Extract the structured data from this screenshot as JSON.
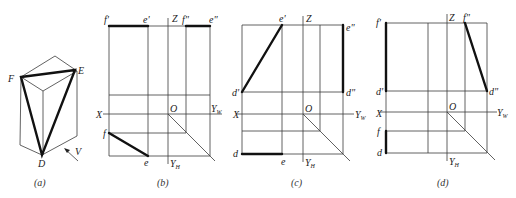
{
  "figure": {
    "panels": [
      {
        "id": "a",
        "caption": "(a)",
        "description": "Isometric view of a prism with triangle DEF drawn on it; arrow V indicates viewing direction",
        "labels": {
          "F": "F",
          "E": "E",
          "D": "D",
          "V": "V"
        }
      },
      {
        "id": "b",
        "caption": "(b)",
        "labels": {
          "f_prime": "f'",
          "e_prime": "e'",
          "Z": "Z",
          "f_dprime": "f\"",
          "e_dprime": "e\"",
          "X": "X",
          "O": "O",
          "Yw": "Y",
          "Yw_sub": "W",
          "f": "f",
          "e": "e",
          "Yh": "Y",
          "Yh_sub": "H"
        }
      },
      {
        "id": "c",
        "caption": "(c)",
        "labels": {
          "e_prime": "e'",
          "Z": "Z",
          "e_dprime": "e\"",
          "d_prime": "d'",
          "d_dprime": "d\"",
          "X": "X",
          "O": "O",
          "Yw": "Y",
          "Yw_sub": "W",
          "d": "d",
          "e": "e",
          "Yh": "Y",
          "Yh_sub": "H"
        }
      },
      {
        "id": "d",
        "caption": "(d)",
        "labels": {
          "f_prime": "f'",
          "Z": "Z",
          "f_dprime": "f\"",
          "d_prime": "d'",
          "d_dprime": "d\"",
          "X": "X",
          "O": "O",
          "Yw": "Y",
          "Yw_sub": "W",
          "f": "f",
          "d": "d",
          "Yh": "Y",
          "Yh_sub": "H"
        }
      }
    ]
  }
}
